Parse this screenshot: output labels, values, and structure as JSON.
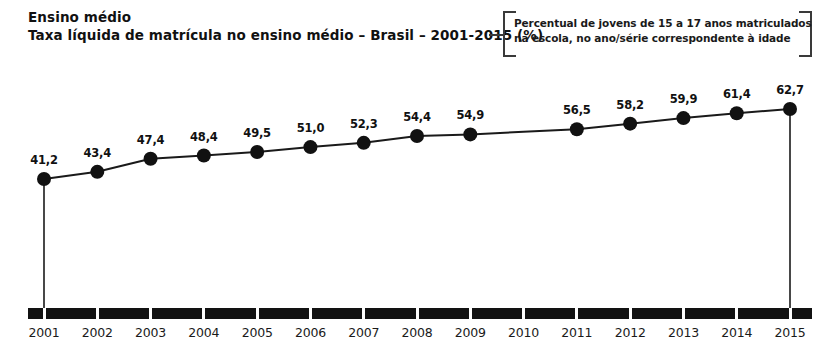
{
  "header": {
    "line1": "Ensino médio",
    "line2": "Taxa líquida de matrícula no ensino médio – Brasil – 2001-2015 (%)"
  },
  "callout": {
    "line1": "Percentual de jovens de 15 a 17 anos matriculados",
    "line2": "na escola, no ano/série correspondente à idade"
  },
  "chart_data": {
    "type": "line",
    "title": "Taxa líquida de matrícula no ensino médio – Brasil – 2001-2015 (%)",
    "subtitle": "Ensino médio",
    "note": "Percentual de jovens de 15 a 17 anos matriculados na escola, no ano/série correspondente à idade",
    "xlabel": "",
    "ylabel": "",
    "unit": "%",
    "decimal_separator": ",",
    "grid": false,
    "legend": "none",
    "ylim": [
      0,
      70
    ],
    "categories": [
      "2001",
      "2002",
      "2003",
      "2004",
      "2005",
      "2006",
      "2007",
      "2008",
      "2009",
      "2010",
      "2011",
      "2012",
      "2013",
      "2014",
      "2015"
    ],
    "values": [
      41.2,
      43.4,
      47.4,
      48.4,
      49.5,
      51.0,
      52.3,
      54.4,
      54.9,
      null,
      56.5,
      58.2,
      59.9,
      61.4,
      62.7
    ],
    "labels": [
      "41,2",
      "43,4",
      "47,4",
      "48,4",
      "49,5",
      "51,0",
      "52,3",
      "54,4",
      "54,9",
      "",
      "56,5",
      "58,2",
      "59,9",
      "61,4",
      "62,7"
    ],
    "marker_shown": [
      true,
      true,
      true,
      true,
      true,
      true,
      true,
      true,
      true,
      false,
      true,
      true,
      true,
      true,
      true
    ],
    "series": [
      {
        "name": "Taxa líquida de matrícula no ensino médio",
        "values": [
          41.2,
          43.4,
          47.4,
          48.4,
          49.5,
          51.0,
          52.3,
          54.4,
          54.9,
          null,
          56.5,
          58.2,
          59.9,
          61.4,
          62.7
        ]
      }
    ],
    "colors": {
      "line": "#1a1a1a",
      "marker": "#111111",
      "axis": "#121212",
      "text": "#1a1a1a"
    }
  }
}
